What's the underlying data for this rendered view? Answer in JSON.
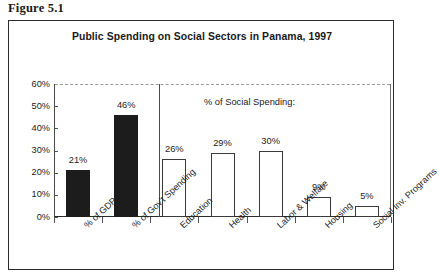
{
  "figure": {
    "caption": "Figure 5.1"
  },
  "chart": {
    "title": "Public Spending on Social Sectors in Panama, 1997",
    "annotation": "% of Social Spending:"
  },
  "chart_data": {
    "type": "bar",
    "title": "Public Spending on Social Sectors in Panama, 1997",
    "xlabel": "",
    "ylabel": "",
    "ylim": [
      0,
      60
    ],
    "ytick_labels": [
      "0%",
      "10%",
      "20%",
      "30%",
      "40%",
      "50%",
      "60%"
    ],
    "ytick_values": [
      0,
      10,
      20,
      30,
      40,
      50,
      60
    ],
    "grid": true,
    "legend": null,
    "annotations": [
      "% of Social Spending:"
    ],
    "categories": [
      "% of GDP",
      "% of Gov't Spending",
      "Education",
      "Health",
      "Labor & Welfare",
      "Housing",
      "Social Inv. Programs"
    ],
    "values": [
      21,
      46,
      26,
      29,
      30,
      9,
      5
    ],
    "data_labels": [
      "21%",
      "46%",
      "26%",
      "29%",
      "30%",
      "9%",
      "5%"
    ],
    "bar_styles": [
      "filled",
      "filled",
      "hollow",
      "hollow",
      "hollow",
      "hollow",
      "hollow"
    ],
    "colors": {
      "filled": "#1c1c1c",
      "hollow": "#ffffff",
      "outline": "#3a3a3a"
    },
    "groups": [
      {
        "name": "share measures",
        "categories": [
          "% of GDP",
          "% of Gov't Spending"
        ]
      },
      {
        "name": "% of Social Spending:",
        "categories": [
          "Education",
          "Health",
          "Labor & Welfare",
          "Housing",
          "Social Inv. Programs"
        ]
      }
    ]
  }
}
